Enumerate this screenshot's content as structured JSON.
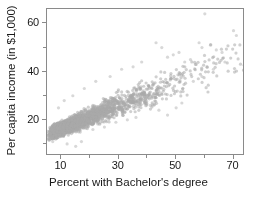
{
  "chart_data": {
    "type": "scatter",
    "title": "",
    "xlabel": "Percent with Bachelor's degree",
    "ylabel": "Per capita income (in $1,000)",
    "xlim": [
      5,
      74
    ],
    "ylim": [
      5,
      66
    ],
    "xticks_major": [
      10,
      30,
      50,
      70
    ],
    "xticks_minor": [
      20,
      40,
      60
    ],
    "yticks_major": [
      20,
      40,
      60
    ],
    "yticks_minor": [
      10,
      30,
      50
    ],
    "grid": false,
    "legend": null,
    "point_color": "#a9a9a9",
    "point_radius": 1.6,
    "point_opacity": 0.55,
    "n_points": 3100,
    "correlation": 0.72,
    "cluster": {
      "x_mode": 13,
      "x_skew": "right",
      "y_intercept": 11.5,
      "y_slope": 0.48,
      "y_noise_base": 2.2,
      "y_noise_growth": 0.09
    },
    "series": [
      {
        "name": "counties",
        "points_summary": [
          {
            "x": 7,
            "y": 13.5
          },
          {
            "x": 8,
            "y": 14.8
          },
          {
            "x": 9,
            "y": 15.6
          },
          {
            "x": 10,
            "y": 16.4
          },
          {
            "x": 12,
            "y": 17.8
          },
          {
            "x": 14,
            "y": 19.0
          },
          {
            "x": 16,
            "y": 20.2
          },
          {
            "x": 18,
            "y": 21.2
          },
          {
            "x": 20,
            "y": 22.1
          },
          {
            "x": 24,
            "y": 23.6
          },
          {
            "x": 28,
            "y": 25.2
          },
          {
            "x": 32,
            "y": 27.0
          },
          {
            "x": 36,
            "y": 28.8
          },
          {
            "x": 40,
            "y": 30.6
          },
          {
            "x": 45,
            "y": 33.0
          },
          {
            "x": 50,
            "y": 35.5
          },
          {
            "x": 55,
            "y": 38.0
          },
          {
            "x": 60,
            "y": 41.0
          },
          {
            "x": 65,
            "y": 44.5
          },
          {
            "x": 70,
            "y": 48.0
          }
        ]
      }
    ]
  },
  "axes": {
    "x": {
      "title": "Percent with Bachelor's degree",
      "tick_labels": [
        "10",
        "30",
        "50",
        "70"
      ]
    },
    "y": {
      "title": "Per capita income (in $1,000)",
      "tick_labels": [
        "20",
        "40",
        "60"
      ]
    }
  }
}
